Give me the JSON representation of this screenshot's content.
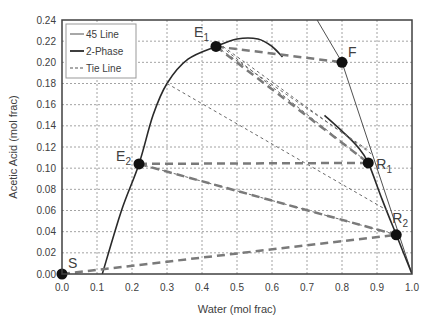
{
  "chart_data": {
    "type": "line",
    "title": "",
    "xlabel": "Water (mol frac)",
    "ylabel": "Acetic Acid (mol frac)",
    "xlim": [
      0.0,
      1.0
    ],
    "ylim": [
      0.0,
      0.24
    ],
    "grid": true,
    "legend_position": "upper-left",
    "x_ticks": [
      "0.0",
      "0.1",
      "0.2",
      "0.3",
      "0.4",
      "0.5",
      "0.6",
      "0.7",
      "0.8",
      "0.9",
      "1.0"
    ],
    "y_ticks": [
      "0.00",
      "0.02",
      "0.04",
      "0.06",
      "0.08",
      "0.10",
      "0.12",
      "0.14",
      "0.16",
      "0.18",
      "0.20",
      "0.22",
      "0.24"
    ],
    "legend": [
      {
        "label": "45 Line",
        "style": "thin-solid"
      },
      {
        "label": "2-Phase",
        "style": "thick-solid"
      },
      {
        "label": "Tie Line",
        "style": "dashed"
      }
    ],
    "series": [
      {
        "name": "45 Line",
        "points": [
          [
            0.72,
            0.245
          ],
          [
            0.8,
            0.2
          ],
          [
            1.0,
            0.0
          ]
        ]
      },
      {
        "name": "2-Phase",
        "segments": [
          [
            [
              0.115,
              0.0
            ],
            [
              0.17,
              0.06
            ],
            [
              0.22,
              0.104
            ],
            [
              0.26,
              0.15
            ],
            [
              0.3,
              0.18
            ],
            [
              0.36,
              0.203
            ],
            [
              0.44,
              0.215
            ],
            [
              0.5,
              0.222
            ],
            [
              0.56,
              0.222
            ],
            [
              0.6,
              0.215
            ],
            [
              0.63,
              0.205
            ]
          ],
          [
            [
              0.75,
              0.15
            ],
            [
              0.8,
              0.135
            ],
            [
              0.845,
              0.12
            ],
            [
              0.875,
              0.105
            ],
            [
              0.915,
              0.07
            ],
            [
              0.955,
              0.037
            ],
            [
              1.0,
              0.0
            ]
          ]
        ]
      },
      {
        "name": "Tie Line",
        "thin_lines": [
          [
            [
              0.44,
              0.215
            ],
            [
              0.875,
              0.117
            ]
          ],
          [
            [
              0.46,
              0.215
            ],
            [
              0.89,
              0.112
            ]
          ],
          [
            [
              0.47,
              0.211
            ],
            [
              0.875,
              0.105
            ]
          ],
          [
            [
              0.3,
              0.18
            ],
            [
              0.93,
              0.06
            ]
          ],
          [
            [
              0.22,
              0.104
            ],
            [
              0.955,
              0.037
            ]
          ]
        ],
        "thick_lines": [
          [
            [
              0.44,
              0.215
            ],
            [
              0.8,
              0.2
            ]
          ],
          [
            [
              0.44,
              0.215
            ],
            [
              0.875,
              0.105
            ]
          ],
          [
            [
              0.22,
              0.104
            ],
            [
              0.875,
              0.105
            ]
          ],
          [
            [
              0.22,
              0.104
            ],
            [
              0.955,
              0.037
            ]
          ],
          [
            [
              0.0,
              0.0
            ],
            [
              0.955,
              0.037
            ]
          ]
        ]
      }
    ],
    "annotations": [
      {
        "label": "E",
        "sub": "1",
        "x": 0.44,
        "y": 0.215
      },
      {
        "label": "F",
        "sub": "",
        "x": 0.8,
        "y": 0.2
      },
      {
        "label": "E",
        "sub": "2",
        "x": 0.22,
        "y": 0.104
      },
      {
        "label": "R",
        "sub": "1",
        "x": 0.875,
        "y": 0.105
      },
      {
        "label": "R",
        "sub": "2",
        "x": 0.955,
        "y": 0.037
      },
      {
        "label": "S",
        "sub": "",
        "x": 0.0,
        "y": 0.0
      }
    ]
  }
}
